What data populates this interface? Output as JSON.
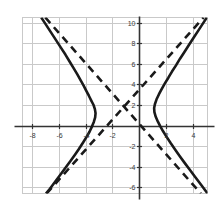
{
  "figure": {
    "title": "",
    "background_color": "#ffffff",
    "width": 222,
    "height": 209
  },
  "chart_data": {
    "type": "line",
    "title": "",
    "subtitle": "",
    "xlabel": "",
    "ylabel": "",
    "xlim": [
      -8.7,
      5.1
    ],
    "ylim": [
      -6.6,
      10.5
    ],
    "grid": true,
    "grid_color": "#c9c9c9",
    "grid_spacing_x": 2,
    "grid_spacing_y": 2,
    "legend": null,
    "legend_position": "none",
    "axis_color": "#333333",
    "xticks": [
      -8,
      -6,
      -4,
      -2,
      2,
      4
    ],
    "yticks": [
      10,
      8,
      6,
      4,
      2,
      -2,
      -4,
      -6
    ],
    "xtick_labels": [
      "-8",
      "-6",
      "-4",
      "-2",
      "2",
      "4"
    ],
    "ytick_labels": [
      "10",
      "8",
      "6",
      "4",
      "2",
      "-2",
      "-4",
      "-6"
    ],
    "annotations": [],
    "curve_description": "Horizontal hyperbola centered near (-1, 2) with vertices near (-3.1, 2) and (1.1, 2), drawn as a solid black curve, plus its two dashed straight asymptotes crossing at the center.",
    "series": [
      {
        "name": "hyperbola-left-branch",
        "style": "solid",
        "color": "#1a1a1a",
        "width": 2.6,
        "points": [
          [
            -7.3,
            10.5
          ],
          [
            -7.05,
            10.0
          ],
          [
            -6.6,
            9.1
          ],
          [
            -6.2,
            8.3
          ],
          [
            -5.85,
            7.6
          ],
          [
            -5.5,
            6.9
          ],
          [
            -5.2,
            6.25
          ],
          [
            -4.9,
            5.6
          ],
          [
            -4.62,
            5.0
          ],
          [
            -4.38,
            4.45
          ],
          [
            -4.15,
            3.9
          ],
          [
            -3.95,
            3.4
          ],
          [
            -3.75,
            2.9
          ],
          [
            -3.58,
            2.45
          ],
          [
            -3.4,
            2.0
          ],
          [
            -3.3,
            1.6
          ],
          [
            -3.25,
            1.2
          ],
          [
            -3.28,
            0.8
          ],
          [
            -3.38,
            0.35
          ],
          [
            -3.52,
            -0.1
          ],
          [
            -3.7,
            -0.6
          ],
          [
            -3.92,
            -1.1
          ],
          [
            -4.18,
            -1.65
          ],
          [
            -4.48,
            -2.25
          ],
          [
            -4.8,
            -2.85
          ],
          [
            -5.15,
            -3.5
          ],
          [
            -5.52,
            -4.15
          ],
          [
            -5.92,
            -4.85
          ],
          [
            -6.35,
            -5.6
          ],
          [
            -6.75,
            -6.3
          ],
          [
            -6.95,
            -6.6
          ]
        ]
      },
      {
        "name": "hyperbola-right-branch",
        "style": "solid",
        "color": "#1a1a1a",
        "width": 2.6,
        "points": [
          [
            5.05,
            10.5
          ],
          [
            4.8,
            10.0
          ],
          [
            4.4,
            9.2
          ],
          [
            4.05,
            8.5
          ],
          [
            3.7,
            7.8
          ],
          [
            3.38,
            7.15
          ],
          [
            3.05,
            6.5
          ],
          [
            2.75,
            5.85
          ],
          [
            2.45,
            5.25
          ],
          [
            2.18,
            4.65
          ],
          [
            1.92,
            4.1
          ],
          [
            1.68,
            3.55
          ],
          [
            1.48,
            3.05
          ],
          [
            1.3,
            2.55
          ],
          [
            1.18,
            2.1
          ],
          [
            1.12,
            1.7
          ],
          [
            1.14,
            1.3
          ],
          [
            1.24,
            0.85
          ],
          [
            1.4,
            0.38
          ],
          [
            1.58,
            -0.08
          ],
          [
            1.8,
            -0.58
          ],
          [
            2.05,
            -1.1
          ],
          [
            2.35,
            -1.7
          ],
          [
            2.68,
            -2.32
          ],
          [
            3.02,
            -2.95
          ],
          [
            3.38,
            -3.6
          ],
          [
            3.78,
            -4.3
          ],
          [
            4.18,
            -5.0
          ],
          [
            4.62,
            -5.75
          ],
          [
            5.05,
            -6.5
          ],
          [
            5.1,
            -6.6
          ]
        ]
      },
      {
        "name": "asymptote-negative-slope",
        "style": "dashed",
        "color": "#1a1a1a",
        "width": 2.6,
        "points": [
          [
            -7.0,
            10.5
          ],
          [
            4.6,
            -6.6
          ]
        ]
      },
      {
        "name": "asymptote-positive-slope",
        "style": "dashed",
        "color": "#1a1a1a",
        "width": 2.6,
        "points": [
          [
            -6.9,
            -6.6
          ],
          [
            4.8,
            10.5
          ]
        ]
      }
    ]
  }
}
